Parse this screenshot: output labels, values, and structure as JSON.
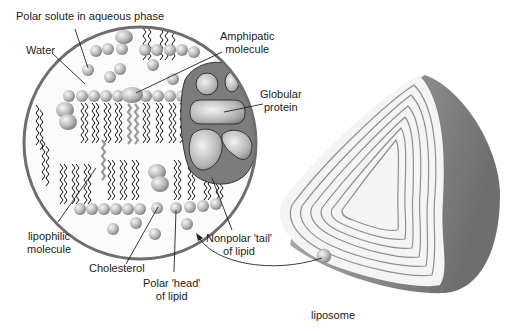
{
  "diagram": {
    "type": "biological membrane / liposome illustration",
    "labels": {
      "polar_solute": "Polar solute in aqueous phase",
      "water": "Water",
      "amphipatic_1": "Amphipatic",
      "amphipatic_2": "molecule",
      "globular_1": "Globular",
      "globular_2": "protein",
      "lipophilic_1": "lipophilic",
      "lipophilic_2": "molecule",
      "cholesterol": "Cholesterol",
      "polar_head_1": "Polar 'head'",
      "polar_head_2": "of lipid",
      "nonpolar_tail_1": "Nonpolar 'tail'",
      "nonpolar_tail_2": "of lipid",
      "liposome": "liposome"
    },
    "colors": {
      "circle_border": "#6e6e6e",
      "sphere_light": "#e6e6e6",
      "sphere_dark": "#8a8a8a",
      "tail_black": "#111111",
      "tail_grey": "#9a9a9a",
      "protein_dark": "#7a7a7a",
      "liposome_shell": "#8c8c8c",
      "liposome_face": "#f4f4f4",
      "liposome_rings": "#8f8f8f"
    }
  }
}
